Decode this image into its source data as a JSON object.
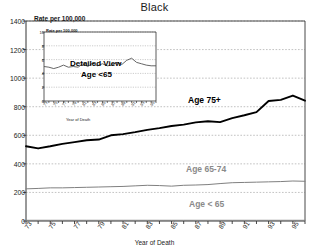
{
  "chart_data": {
    "type": "line",
    "title": "Black",
    "xlabel": "Year of Death",
    "ylabel": "Rate per 100,000",
    "ylim": [
      0,
      1400
    ],
    "xlim": [
      73,
      96
    ],
    "grid": true,
    "legend_position": "inline-annotations",
    "yticks": [
      0,
      200,
      400,
      600,
      800,
      1000,
      1200,
      1400
    ],
    "xticks": [
      "73",
      "75",
      "77",
      "79",
      "81",
      "83",
      "85",
      "87",
      "89",
      "91",
      "93",
      "95"
    ],
    "x": [
      73,
      74,
      75,
      76,
      77,
      78,
      79,
      80,
      81,
      82,
      83,
      84,
      85,
      86,
      87,
      88,
      89,
      90,
      91,
      92,
      93,
      94,
      95,
      96
    ],
    "series": [
      {
        "name": "Age 75+",
        "color": "#000000",
        "values": [
          523,
          508,
          523,
          540,
          552,
          565,
          570,
          600,
          608,
          622,
          638,
          650,
          665,
          675,
          690,
          698,
          692,
          720,
          740,
          762,
          840,
          848,
          878,
          842
        ]
      },
      {
        "name": "Age 65-74",
        "color": "#808080",
        "values": [
          225,
          228,
          232,
          232,
          234,
          236,
          238,
          240,
          242,
          246,
          250,
          248,
          244,
          250,
          252,
          255,
          262,
          268,
          270,
          272,
          274,
          276,
          280,
          278
        ]
      },
      {
        "name": "Age < 65",
        "color": "#808080",
        "values": [
          5,
          5,
          5,
          5,
          5,
          5,
          5,
          5,
          5,
          5,
          5,
          5,
          5,
          5,
          5,
          5,
          5,
          5,
          5,
          5,
          5,
          5,
          5,
          5
        ]
      }
    ],
    "annotations": [
      {
        "text": "Age 75+",
        "series": "Age 75+"
      },
      {
        "text": "Age 65-74",
        "series": "Age 65-74"
      },
      {
        "text": "Age < 65",
        "series": "Age < 65"
      }
    ],
    "inset": {
      "title_line1": "Detailed View",
      "title_line2": "Age  <65",
      "ylabel": "Rate per 100,000",
      "xlabel": "Year of Death",
      "ylim": [
        0,
        10
      ],
      "yticks": [
        0,
        2,
        4,
        6,
        8,
        10
      ],
      "xticks": [
        "73",
        "75",
        "77",
        "79",
        "81",
        "83",
        "85",
        "87",
        "89",
        "91",
        "93",
        "95"
      ],
      "x": [
        73,
        74,
        75,
        76,
        77,
        78,
        79,
        80,
        81,
        82,
        83,
        84,
        85,
        86,
        87,
        88,
        89,
        90,
        91,
        92,
        93,
        94,
        95,
        96
      ],
      "series": [
        {
          "name": "Age <65",
          "color": "#555555",
          "values": [
            5.0,
            4.9,
            4.7,
            4.9,
            5.2,
            4.9,
            5.0,
            4.9,
            5.4,
            5.0,
            5.5,
            5.1,
            5.4,
            5.1,
            5.2,
            5.6,
            5.3,
            5.9,
            6.2,
            5.6,
            5.4,
            5.2,
            5.1,
            5.1
          ]
        }
      ]
    }
  }
}
